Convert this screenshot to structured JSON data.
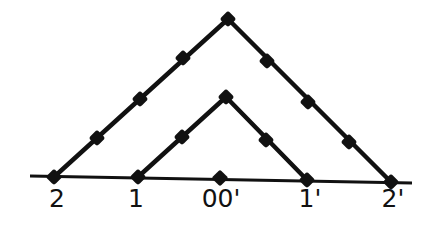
{
  "diagram": {
    "type": "nested-triangles-on-line",
    "colors": {
      "line": "#111111",
      "background": "#ffffff"
    },
    "baseline": {
      "x1": 30,
      "y1": 176,
      "x2": 412,
      "y2": 183
    },
    "outer_triangle": {
      "left": [
        54,
        177
      ],
      "apex": [
        228,
        19
      ],
      "right": [
        391,
        182
      ],
      "dots": [
        [
          54,
          177
        ],
        [
          97,
          138
        ],
        [
          140,
          99
        ],
        [
          183,
          58
        ],
        [
          228,
          19
        ],
        [
          267,
          61
        ],
        [
          308,
          102
        ],
        [
          349,
          142
        ],
        [
          391,
          182
        ]
      ]
    },
    "inner_triangle": {
      "left": [
        138,
        177
      ],
      "apex": [
        226,
        97
      ],
      "right": [
        307,
        180
      ],
      "dots": [
        [
          138,
          177
        ],
        [
          182,
          137
        ],
        [
          226,
          97
        ],
        [
          266,
          140
        ],
        [
          307,
          180
        ]
      ]
    },
    "center_dot": [
      220,
      178
    ],
    "labels": [
      {
        "text": "2",
        "x": 57,
        "y": 186
      },
      {
        "text": "1",
        "x": 136,
        "y": 186
      },
      {
        "text": "00'",
        "x": 221,
        "y": 186
      },
      {
        "text": "1'",
        "x": 310,
        "y": 186
      },
      {
        "text": "2'",
        "x": 393,
        "y": 186
      }
    ]
  }
}
